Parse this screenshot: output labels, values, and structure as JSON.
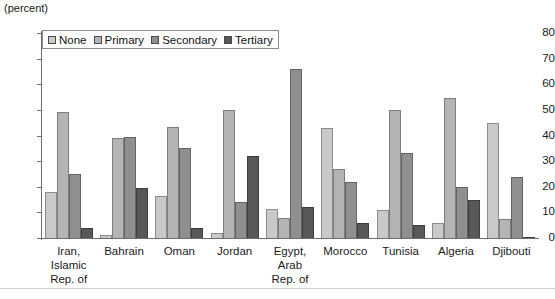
{
  "units_note": "(percent)",
  "legend": {
    "position": "top-left-inside",
    "items": [
      {
        "label": "None",
        "color": "#c9c9c9"
      },
      {
        "label": "Primary",
        "color": "#b4b4b4"
      },
      {
        "label": "Secondary",
        "color": "#8f8f8f"
      },
      {
        "label": "Tertiary",
        "color": "#585858"
      }
    ]
  },
  "y_axis": {
    "ticks": [
      "0",
      "10",
      "20",
      "30",
      "40",
      "50",
      "60",
      "70",
      "80"
    ],
    "min": 0,
    "max": 80,
    "step": 10
  },
  "categories_multiline": [
    [
      "Iran,",
      "Islamic",
      "Rep. of"
    ],
    [
      "Bahrain"
    ],
    [
      "Oman"
    ],
    [
      "Jordan"
    ],
    [
      "Egypt,",
      "Arab",
      "Rep. of"
    ],
    [
      "Morocco"
    ],
    [
      "Tunisia"
    ],
    [
      "Algeria"
    ],
    [
      "Djibouti"
    ]
  ],
  "chart_data": {
    "type": "bar",
    "title": "",
    "subtitle": "",
    "xlabel": "",
    "ylabel": "(percent)",
    "ylim": [
      0,
      80
    ],
    "ytick_step": 10,
    "grid": false,
    "legend_position": "upper left",
    "categories": [
      "Iran, Islamic Rep. of",
      "Bahrain",
      "Oman",
      "Jordan",
      "Egypt, Arab Rep. of",
      "Morocco",
      "Tunisia",
      "Algeria",
      "Djibouti"
    ],
    "series": [
      {
        "name": "None",
        "color": "#c9c9c9",
        "values": [
          18,
          1,
          16.5,
          2,
          11.5,
          43,
          11,
          6,
          45
        ]
      },
      {
        "name": "Primary",
        "color": "#b4b4b4",
        "values": [
          49,
          39,
          43.5,
          50,
          8,
          27,
          50,
          54.5,
          7.5
        ]
      },
      {
        "name": "Secondary",
        "color": "#8f8f8f",
        "values": [
          25,
          39.5,
          35,
          14,
          66,
          22,
          33,
          20,
          24
        ]
      },
      {
        "name": "Tertiary",
        "color": "#585858",
        "values": [
          4,
          19.5,
          4,
          32,
          12,
          6,
          5,
          15,
          0.5
        ]
      }
    ]
  }
}
